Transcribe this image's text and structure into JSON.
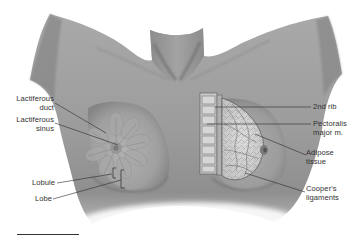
{
  "figure": {
    "style": "grayscale anatomical illustration",
    "colors": {
      "background": "#ffffff",
      "skin": "#9a9a9a",
      "skin_light": "#b8b8b8",
      "skin_dark": "#6e6e6e",
      "label_text": "#333333",
      "leader_line": "#2a2a2a"
    }
  },
  "labels_left": [
    {
      "id": "lactiferous-duct",
      "text": "Lactiferous\nduct"
    },
    {
      "id": "lactiferous-sinus",
      "text": "Lactiferous\nsinus"
    },
    {
      "id": "lobule",
      "text": "Lobule"
    },
    {
      "id": "lobe",
      "text": "Lobe"
    }
  ],
  "labels_right": [
    {
      "id": "2nd-rib",
      "text": "2nd rib"
    },
    {
      "id": "pectoralis-major",
      "text": "Pectoralis\nmajor m."
    },
    {
      "id": "adipose-tissue",
      "text": "Adipose\ntissue"
    },
    {
      "id": "coopers-ligaments",
      "text": "Cooper's\nligaments"
    }
  ],
  "scale_bar": {
    "visible": true
  }
}
